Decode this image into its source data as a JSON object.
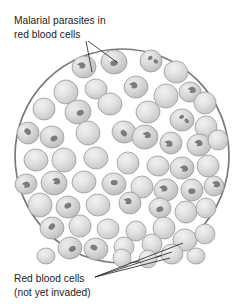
{
  "figure": {
    "background_color": "#ffffff",
    "field": {
      "shape": "circle",
      "center_x": 122,
      "center_y": 156,
      "radius": 107,
      "outline_color": "#7a7a7a",
      "fill_color": "#ffffff"
    },
    "cell_colors": {
      "body_fill": "#d7d7d7",
      "body_highlight": "#efefef",
      "body_outline": "#9b9b9b",
      "parasite_fill": "#7c7c7c"
    }
  },
  "labels": {
    "top": {
      "id": "malarial-parasites-label",
      "line1": "Malarial parasites in",
      "line2": "red blood cells",
      "x": 14,
      "y1": 24,
      "y2": 38,
      "leader_count": 2
    },
    "bottom": {
      "id": "red-blood-cells-label",
      "line1": "Red blood cells",
      "line2": "(not yet invaded)",
      "x": 14,
      "y1": 282,
      "y2": 296,
      "leader_count": 3
    }
  },
  "leader_lines": {
    "top": [
      {
        "name": "leader-to-parasite-cell-a",
        "x1": 86,
        "y1": 41,
        "x2": 92,
        "y2": 72
      },
      {
        "name": "leader-to-parasite-cell-b",
        "x1": 88,
        "y1": 41,
        "x2": 118,
        "y2": 63
      }
    ],
    "bottom": [
      {
        "name": "leader-to-clean-cell-a",
        "x1": 95,
        "y1": 277,
        "x2": 183,
        "y2": 243
      },
      {
        "name": "leader-to-clean-cell-b",
        "x1": 95,
        "y1": 277,
        "x2": 172,
        "y2": 252
      },
      {
        "name": "leader-to-clean-cell-c",
        "x1": 95,
        "y1": 277,
        "x2": 170,
        "y2": 258
      }
    ]
  },
  "chart_data": {
    "type": "diagram",
    "title": "Malarial parasites in red blood cells",
    "legend": [
      "Malarial parasites in red blood cells",
      "Red blood cells (not yet invaded)"
    ],
    "counts": {
      "total_cells": 62,
      "infected_cells": 27,
      "uninfected_cells": 35
    },
    "cells": [
      {
        "cx": 84,
        "cy": 67,
        "rx": 12,
        "ry": 11,
        "rot": -8,
        "infected": true,
        "parasite": "comma"
      },
      {
        "cx": 114,
        "cy": 62,
        "rx": 13,
        "ry": 12,
        "rot": 6,
        "infected": true,
        "parasite": "blob"
      },
      {
        "cx": 151,
        "cy": 61,
        "rx": 11,
        "ry": 11,
        "rot": 0,
        "infected": true,
        "parasite": "double"
      },
      {
        "cx": 176,
        "cy": 72,
        "rx": 12,
        "ry": 11,
        "rot": 12,
        "infected": false,
        "parasite": "none"
      },
      {
        "cx": 66,
        "cy": 92,
        "rx": 12,
        "ry": 12,
        "rot": -14,
        "infected": false,
        "parasite": "none"
      },
      {
        "cx": 96,
        "cy": 89,
        "rx": 11,
        "ry": 10,
        "rot": 4,
        "infected": false,
        "parasite": "none"
      },
      {
        "cx": 136,
        "cy": 87,
        "rx": 12,
        "ry": 11,
        "rot": -6,
        "infected": true,
        "parasite": "comma"
      },
      {
        "cx": 166,
        "cy": 96,
        "rx": 12,
        "ry": 12,
        "rot": 10,
        "infected": false,
        "parasite": "none"
      },
      {
        "cx": 190,
        "cy": 92,
        "rx": 11,
        "ry": 10,
        "rot": -5,
        "infected": true,
        "parasite": "comma"
      },
      {
        "cx": 205,
        "cy": 103,
        "rx": 11,
        "ry": 11,
        "rot": 8,
        "infected": false,
        "parasite": "none"
      },
      {
        "cx": 44,
        "cy": 109,
        "rx": 11,
        "ry": 11,
        "rot": 0,
        "infected": false,
        "parasite": "none"
      },
      {
        "cx": 78,
        "cy": 112,
        "rx": 13,
        "ry": 12,
        "rot": -10,
        "infected": true,
        "parasite": "blob"
      },
      {
        "cx": 110,
        "cy": 104,
        "rx": 12,
        "ry": 11,
        "rot": 5,
        "infected": false,
        "parasite": "none"
      },
      {
        "cx": 148,
        "cy": 112,
        "rx": 12,
        "ry": 11,
        "rot": -8,
        "infected": false,
        "parasite": "none"
      },
      {
        "cx": 182,
        "cy": 120,
        "rx": 12,
        "ry": 11,
        "rot": 6,
        "infected": true,
        "parasite": "double"
      },
      {
        "cx": 206,
        "cy": 127,
        "rx": 11,
        "ry": 11,
        "rot": 0,
        "infected": false,
        "parasite": "none"
      },
      {
        "cx": 28,
        "cy": 133,
        "rx": 11,
        "ry": 11,
        "rot": -12,
        "infected": true,
        "parasite": "blob"
      },
      {
        "cx": 52,
        "cy": 137,
        "rx": 12,
        "ry": 11,
        "rot": 7,
        "infected": true,
        "parasite": "blob"
      },
      {
        "cx": 88,
        "cy": 133,
        "rx": 12,
        "ry": 12,
        "rot": -4,
        "infected": false,
        "parasite": "none"
      },
      {
        "cx": 124,
        "cy": 132,
        "rx": 12,
        "ry": 11,
        "rot": 9,
        "infected": true,
        "parasite": "blob"
      },
      {
        "cx": 145,
        "cy": 137,
        "rx": 13,
        "ry": 12,
        "rot": -6,
        "infected": true,
        "parasite": "comma"
      },
      {
        "cx": 171,
        "cy": 143,
        "rx": 11,
        "ry": 11,
        "rot": 3,
        "infected": true,
        "parasite": "comma"
      },
      {
        "cx": 199,
        "cy": 145,
        "rx": 12,
        "ry": 11,
        "rot": -9,
        "infected": true,
        "parasite": "comma"
      },
      {
        "cx": 218,
        "cy": 140,
        "rx": 10,
        "ry": 10,
        "rot": 0,
        "infected": false,
        "parasite": "none"
      },
      {
        "cx": 36,
        "cy": 160,
        "rx": 12,
        "ry": 11,
        "rot": 6,
        "infected": false,
        "parasite": "none"
      },
      {
        "cx": 64,
        "cy": 160,
        "rx": 12,
        "ry": 12,
        "rot": -7,
        "infected": false,
        "parasite": "none"
      },
      {
        "cx": 96,
        "cy": 158,
        "rx": 12,
        "ry": 11,
        "rot": 4,
        "infected": false,
        "parasite": "none"
      },
      {
        "cx": 128,
        "cy": 163,
        "rx": 11,
        "ry": 11,
        "rot": 0,
        "infected": false,
        "parasite": "none"
      },
      {
        "cx": 158,
        "cy": 166,
        "rx": 11,
        "ry": 10,
        "rot": 8,
        "infected": false,
        "parasite": "none"
      },
      {
        "cx": 182,
        "cy": 168,
        "rx": 12,
        "ry": 11,
        "rot": -5,
        "infected": true,
        "parasite": "comma"
      },
      {
        "cx": 208,
        "cy": 166,
        "rx": 11,
        "ry": 11,
        "rot": 7,
        "infected": false,
        "parasite": "none"
      },
      {
        "cx": 26,
        "cy": 184,
        "rx": 11,
        "ry": 10,
        "rot": -10,
        "infected": true,
        "parasite": "comma"
      },
      {
        "cx": 54,
        "cy": 183,
        "rx": 13,
        "ry": 12,
        "rot": 5,
        "infected": true,
        "parasite": "comma"
      },
      {
        "cx": 84,
        "cy": 182,
        "rx": 12,
        "ry": 11,
        "rot": -6,
        "infected": false,
        "parasite": "none"
      },
      {
        "cx": 114,
        "cy": 184,
        "rx": 12,
        "ry": 11,
        "rot": 9,
        "infected": true,
        "parasite": "blob"
      },
      {
        "cx": 142,
        "cy": 187,
        "rx": 11,
        "ry": 11,
        "rot": 0,
        "infected": false,
        "parasite": "none"
      },
      {
        "cx": 166,
        "cy": 190,
        "rx": 12,
        "ry": 11,
        "rot": -8,
        "infected": true,
        "parasite": "comma"
      },
      {
        "cx": 192,
        "cy": 190,
        "rx": 11,
        "ry": 11,
        "rot": 6,
        "infected": true,
        "parasite": "blob"
      },
      {
        "cx": 214,
        "cy": 186,
        "rx": 10,
        "ry": 10,
        "rot": 0,
        "infected": true,
        "parasite": "comma"
      },
      {
        "cx": 40,
        "cy": 205,
        "rx": 12,
        "ry": 12,
        "rot": 7,
        "infected": false,
        "parasite": "none"
      },
      {
        "cx": 68,
        "cy": 207,
        "rx": 12,
        "ry": 11,
        "rot": -5,
        "infected": true,
        "parasite": "blob"
      },
      {
        "cx": 98,
        "cy": 205,
        "rx": 12,
        "ry": 11,
        "rot": 4,
        "infected": false,
        "parasite": "none"
      },
      {
        "cx": 130,
        "cy": 203,
        "rx": 11,
        "ry": 11,
        "rot": 0,
        "infected": true,
        "parasite": "comma"
      },
      {
        "cx": 160,
        "cy": 208,
        "rx": 11,
        "ry": 10,
        "rot": 8,
        "infected": true,
        "parasite": "blob"
      },
      {
        "cx": 186,
        "cy": 212,
        "rx": 11,
        "ry": 11,
        "rot": -7,
        "infected": false,
        "parasite": "none"
      },
      {
        "cx": 206,
        "cy": 208,
        "rx": 10,
        "ry": 10,
        "rot": 0,
        "infected": false,
        "parasite": "none"
      },
      {
        "cx": 52,
        "cy": 228,
        "rx": 12,
        "ry": 11,
        "rot": -6,
        "infected": true,
        "parasite": "blob"
      },
      {
        "cx": 80,
        "cy": 226,
        "rx": 11,
        "ry": 11,
        "rot": 5,
        "infected": false,
        "parasite": "none"
      },
      {
        "cx": 108,
        "cy": 229,
        "rx": 11,
        "ry": 10,
        "rot": 0,
        "infected": false,
        "parasite": "none"
      },
      {
        "cx": 136,
        "cy": 231,
        "rx": 10,
        "ry": 10,
        "rot": 7,
        "infected": false,
        "parasite": "none"
      },
      {
        "cx": 164,
        "cy": 228,
        "rx": 11,
        "ry": 11,
        "rot": -4,
        "infected": false,
        "parasite": "none"
      },
      {
        "cx": 185,
        "cy": 240,
        "rx": 12,
        "ry": 11,
        "rot": 6,
        "infected": false,
        "parasite": "none"
      },
      {
        "cx": 205,
        "cy": 234,
        "rx": 10,
        "ry": 10,
        "rot": 0,
        "infected": false,
        "parasite": "none"
      },
      {
        "cx": 70,
        "cy": 248,
        "rx": 12,
        "ry": 11,
        "rot": -8,
        "infected": true,
        "parasite": "blob"
      },
      {
        "cx": 96,
        "cy": 249,
        "rx": 12,
        "ry": 11,
        "rot": 5,
        "infected": true,
        "parasite": "blob"
      },
      {
        "cx": 124,
        "cy": 247,
        "rx": 10,
        "ry": 10,
        "rot": 0,
        "infected": false,
        "parasite": "none"
      },
      {
        "cx": 152,
        "cy": 244,
        "rx": 10,
        "ry": 10,
        "rot": 4,
        "infected": false,
        "parasite": "none"
      },
      {
        "cx": 172,
        "cy": 254,
        "rx": 11,
        "ry": 10,
        "rot": -5,
        "infected": false,
        "parasite": "none"
      },
      {
        "cx": 148,
        "cy": 259,
        "rx": 9,
        "ry": 9,
        "rot": 0,
        "infected": false,
        "parasite": "none"
      },
      {
        "cx": 122,
        "cy": 258,
        "rx": 9,
        "ry": 9,
        "rot": 0,
        "infected": false,
        "parasite": "none"
      },
      {
        "cx": 46,
        "cy": 256,
        "rx": 9,
        "ry": 8,
        "rot": 0,
        "infected": false,
        "parasite": "none"
      },
      {
        "cx": 196,
        "cy": 256,
        "rx": 9,
        "ry": 8,
        "rot": 0,
        "infected": false,
        "parasite": "none"
      }
    ]
  }
}
